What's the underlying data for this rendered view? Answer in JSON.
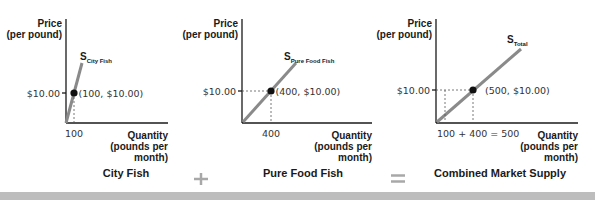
{
  "panels": [
    {
      "id": "city-fish",
      "y_label_1": "Price",
      "y_label_2": "(per pound)",
      "x_label_1": "Quantity",
      "x_label_2": "(pounds per",
      "x_label_3": "month)",
      "curve_label_main": "S",
      "curve_label_sub": "City Fish",
      "price_tick": "$10.00",
      "qty_tick": "100",
      "point_label": "(100, $10.00)",
      "title": "City Fish"
    },
    {
      "id": "pure-food-fish",
      "y_label_1": "Price",
      "y_label_2": "(per pound)",
      "x_label_1": "Quantity",
      "x_label_2": "(pounds per",
      "x_label_3": "month)",
      "curve_label_main": "S",
      "curve_label_sub": "Pure Food Fish",
      "price_tick": "$10.00",
      "qty_tick": "400",
      "point_label": "(400, $10.00)",
      "title": "Pure Food Fish"
    },
    {
      "id": "combined",
      "y_label_1": "Price",
      "y_label_2": "(per pound)",
      "x_label_1": "Quantity",
      "x_label_2": "(pounds per",
      "x_label_3": "month)",
      "curve_label_main": "S",
      "curve_label_sub": "Total",
      "price_tick": "$10.00",
      "qty_tick": "100 + 400 = 500",
      "point_label": "(500, $10.00)",
      "title": "Combined Market Supply"
    }
  ],
  "operators": {
    "plus": "+",
    "equals": "="
  },
  "points": [
    {
      "quantity": 100,
      "price": 10.0
    },
    {
      "quantity": 400,
      "price": 10.0
    },
    {
      "quantity": 500,
      "price": 10.0
    }
  ]
}
